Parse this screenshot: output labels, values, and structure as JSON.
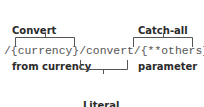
{
  "annotations": {
    "convert_from_currency": {
      "line1": "Convert",
      "line2": "from currency"
    },
    "catch_all_parameter": {
      "line1": "Catch-all",
      "line2": "parameter"
    },
    "literal_segment": {
      "line1": "Literal",
      "line2": "segment"
    }
  },
  "route": {
    "text": "/{currency}/convert/{**others}"
  },
  "colors": {
    "label": "#2b2b2b",
    "route_text": "#555555",
    "bracket": "#555555"
  }
}
